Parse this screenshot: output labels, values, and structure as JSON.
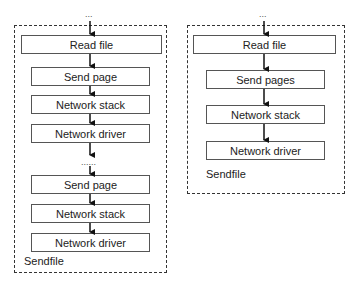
{
  "left_panel": {
    "top_ellipsis": "...",
    "mid_ellipsis": "......",
    "caption": "Sendfile",
    "blocks": [
      {
        "label": "Read file"
      },
      {
        "label": "Send page"
      },
      {
        "label": "Network stack"
      },
      {
        "label": "Network driver"
      },
      {
        "label": "Send page"
      },
      {
        "label": "Network stack"
      },
      {
        "label": "Network driver"
      }
    ]
  },
  "right_panel": {
    "top_ellipsis": "...",
    "caption": "Sendfile",
    "blocks": [
      {
        "label": "Read file"
      },
      {
        "label": "Send pages"
      },
      {
        "label": "Network stack"
      },
      {
        "label": "Network driver"
      }
    ]
  }
}
